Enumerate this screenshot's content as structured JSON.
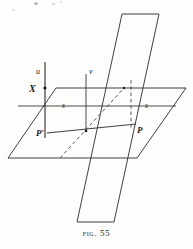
{
  "figure": {
    "caption_prefix": "Fig.",
    "caption_number": "55",
    "caption_full": "Fig. 55",
    "alt": "Two intersecting planes: a horizontal plane and a vertical plane, with line s lying in the horizontal plane, vertical line u through X, line v in the vertical plane, and points P and P-prime joined by a transversal."
  },
  "labels": {
    "u": "u",
    "X": "X",
    "v": "v",
    "s_left": "s",
    "s_right": "s",
    "P_prime": "P′",
    "P": "P"
  },
  "colors": {
    "ink": "#1c1c1c",
    "line": "#2b2b2b",
    "paper": "#fdfdfc",
    "dashed": "#3a3a3a"
  },
  "geometry": {
    "horizontal_plane": {
      "type": "parallelogram",
      "points": "56,88 186,88 137,158 8,158"
    },
    "vertical_plane": {
      "type": "parallelogram",
      "points": "77,222 122,14 159,14 114,222"
    },
    "line_u": {
      "x1": 45,
      "y1": 62,
      "x2": 45,
      "y2": 138
    },
    "point_X": {
      "cx": 45,
      "cy": 88,
      "r": 1.6
    },
    "line_v": {
      "x1": 86,
      "y1": 74,
      "x2": 86,
      "y2": 132
    },
    "line_s": {
      "x1": 18,
      "y1": 106,
      "x2": 176,
      "y2": 106
    },
    "segment_PP": {
      "x1": 47,
      "y1": 133,
      "x2": 136,
      "y2": 124
    },
    "dashed_diagonal": {
      "x1": 60,
      "y1": 158,
      "x2": 124,
      "y2": 88
    },
    "dashed_vertical": {
      "x1": 131,
      "y1": 80,
      "x2": 131,
      "y2": 128
    }
  }
}
